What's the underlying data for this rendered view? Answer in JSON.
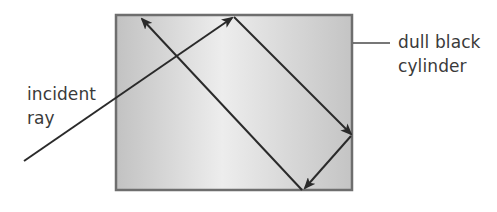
{
  "labels": {
    "incident_line1": "incident",
    "incident_line2": "ray",
    "cylinder_line1": "dull black",
    "cylinder_line2": "cylinder"
  },
  "colors": {
    "box_fill_light": "#ececec",
    "box_fill_dark": "#bdbdbd",
    "box_border": "#6e6e6e",
    "ray": "#2a2a2a",
    "text": "#3a3a3a"
  }
}
